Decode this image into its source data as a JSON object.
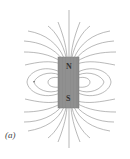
{
  "figure": {
    "caption": "(a)",
    "magnet": {
      "north_label": "N",
      "south_label": "S",
      "fill": "#8c8c8c"
    },
    "line_color": "#8a8a8a",
    "axis_color": "#9a9a9a"
  }
}
